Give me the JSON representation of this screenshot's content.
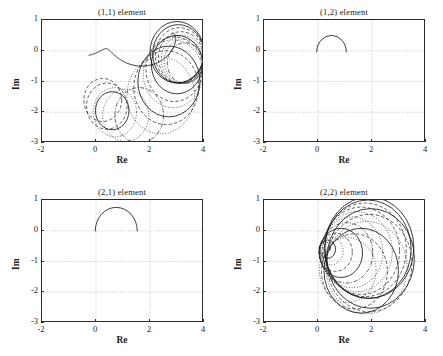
{
  "figure": {
    "layout": "2x2",
    "width": 443,
    "height": 356,
    "background": "#ffffff",
    "line_color": "#1a1a1a",
    "grid_color": "#b9b9b9",
    "frame_color": "#2b2b2b"
  },
  "axes": {
    "xlabel": "Re",
    "ylabel": "Im",
    "xticks": [
      "-2",
      "0",
      "2",
      "4"
    ],
    "xtick_values": [
      -2,
      0,
      2,
      4
    ],
    "yticks": [
      "1",
      "0",
      "-1",
      "-2",
      "-3"
    ],
    "ytick_values": [
      1,
      0,
      -1,
      -2,
      -3
    ],
    "xlim": [
      -2,
      4
    ],
    "ylim": [
      -3,
      1
    ],
    "grid": "dotted-at-integer-ticks"
  },
  "panels": [
    {
      "id": "p11",
      "title": "(1,1) element"
    },
    {
      "id": "p12",
      "title": "(1,2) element"
    },
    {
      "id": "p21",
      "title": "(2,1) element"
    },
    {
      "id": "p22",
      "title": "(2,2) element"
    }
  ],
  "chart_data": {
    "type": "line",
    "xlabel": "Re",
    "ylabel": "Im",
    "xlim": [
      -2,
      4
    ],
    "ylim": [
      -3,
      1
    ],
    "grid": true,
    "legend": "none",
    "subplots": [
      {
        "name": "(1,1) element",
        "description": "Dense family of circular Nyquist loci: a large cluster of near-tangent circles in the right region centered near Re 3, plus smaller circles near Re 0 to 1 around Im -1.8, connected by a spiralling solid locus.",
        "series": [
          {
            "name": "locus-1",
            "style": "solid",
            "shape": "circle",
            "cx": 3.0,
            "cy": -0.05,
            "r": 1.0
          },
          {
            "name": "locus-2",
            "style": "solid",
            "shape": "circle",
            "cx": 3.05,
            "cy": -0.1,
            "r": 0.95
          },
          {
            "name": "locus-3",
            "style": "dashed",
            "shape": "circle",
            "cx": 3.1,
            "cy": -0.15,
            "r": 0.9
          },
          {
            "name": "locus-4",
            "style": "dashed",
            "shape": "circle",
            "cx": 3.15,
            "cy": -0.22,
            "r": 0.84
          },
          {
            "name": "locus-5",
            "style": "dotted",
            "shape": "circle",
            "cx": 3.2,
            "cy": -0.28,
            "r": 0.78
          },
          {
            "name": "locus-6",
            "style": "dotted",
            "shape": "circle",
            "cx": 3.25,
            "cy": -0.34,
            "r": 0.72
          },
          {
            "name": "locus-7",
            "style": "dashdot",
            "shape": "circle",
            "cx": 3.3,
            "cy": -0.4,
            "r": 0.66
          },
          {
            "name": "locus-8",
            "style": "solid",
            "shape": "circle",
            "cx": 3.0,
            "cy": -0.45,
            "r": 0.95
          },
          {
            "name": "locus-9",
            "style": "dashed",
            "shape": "circle",
            "cx": 2.9,
            "cy": -0.6,
            "r": 1.05
          },
          {
            "name": "locus-10",
            "style": "dotted",
            "shape": "circle",
            "cx": 2.85,
            "cy": -0.75,
            "r": 1.1
          },
          {
            "name": "locus-11",
            "style": "solid",
            "shape": "circle",
            "cx": 2.7,
            "cy": -1.0,
            "r": 1.15
          },
          {
            "name": "locus-12",
            "style": "dashed",
            "shape": "circle",
            "cx": 2.6,
            "cy": -1.2,
            "r": 1.2
          },
          {
            "name": "locus-13",
            "style": "dotted",
            "shape": "circle",
            "cx": 2.4,
            "cy": -1.45,
            "r": 1.25
          },
          {
            "name": "locus-14",
            "style": "solid",
            "shape": "circle",
            "cx": 0.6,
            "cy": -1.95,
            "r": 0.62
          },
          {
            "name": "locus-15",
            "style": "dashed",
            "shape": "circle",
            "cx": 0.4,
            "cy": -1.8,
            "r": 0.75
          },
          {
            "name": "locus-16",
            "style": "dashed",
            "shape": "circle",
            "cx": 0.25,
            "cy": -1.6,
            "r": 0.7
          },
          {
            "name": "locus-17",
            "style": "dotted",
            "shape": "circle",
            "cx": 0.7,
            "cy": -2.0,
            "r": 0.8
          },
          {
            "name": "locus-18",
            "style": "dotted",
            "shape": "circle",
            "cx": 1.1,
            "cy": -2.1,
            "r": 0.85
          },
          {
            "name": "locus-19",
            "style": "dashdot",
            "shape": "circle",
            "cx": 1.6,
            "cy": -2.1,
            "r": 0.9
          },
          {
            "name": "locus-20",
            "style": "solid",
            "shape": "spiral",
            "from": [
              -0.35,
              -0.15
            ],
            "to": [
              3.0,
              -0.05
            ]
          }
        ]
      },
      {
        "name": "(1,2) element",
        "description": "Single small semicircular locus in the upper-middle region; starts at the origin, loops down to about Im -0.6 and returns to the real axis near Re 1.",
        "series": [
          {
            "name": "locus-1",
            "style": "solid",
            "shape": "arc",
            "cx": 0.5,
            "cy": -0.05,
            "r": 0.55,
            "a0": 0,
            "a1": 180
          }
        ]
      },
      {
        "name": "(2,1) element",
        "description": "Single semicircular locus from the origin dipping to about Im -0.8 and returning to the real axis near Re 1.5.",
        "series": [
          {
            "name": "locus-1",
            "style": "solid",
            "shape": "arc",
            "cx": 0.75,
            "cy": -0.02,
            "r": 0.78,
            "a0": 0,
            "a1": 180
          }
        ]
      },
      {
        "name": "(2,2) element",
        "description": "Family of circular loci all passing through a tight knot near Re 0.2, Im -0.5 and expanding rightward; the largest circles reach Re 3.5 and Im -2.",
        "series": [
          {
            "name": "locus-1",
            "style": "solid",
            "shape": "circle",
            "cx": 1.9,
            "cy": -0.55,
            "r": 1.65
          },
          {
            "name": "locus-2",
            "style": "solid",
            "shape": "circle",
            "cx": 1.85,
            "cy": -0.6,
            "r": 1.6
          },
          {
            "name": "locus-3",
            "style": "dashed",
            "shape": "circle",
            "cx": 1.75,
            "cy": -0.62,
            "r": 1.52
          },
          {
            "name": "locus-4",
            "style": "dashed",
            "shape": "circle",
            "cx": 1.6,
            "cy": -0.65,
            "r": 1.42
          },
          {
            "name": "locus-5",
            "style": "dotted",
            "shape": "circle",
            "cx": 1.45,
            "cy": -0.68,
            "r": 1.3
          },
          {
            "name": "locus-6",
            "style": "dotted",
            "shape": "circle",
            "cx": 1.25,
            "cy": -0.7,
            "r": 1.15
          },
          {
            "name": "locus-7",
            "style": "dashdot",
            "shape": "circle",
            "cx": 1.05,
            "cy": -0.72,
            "r": 0.98
          },
          {
            "name": "locus-8",
            "style": "solid",
            "shape": "circle",
            "cx": 0.85,
            "cy": -0.72,
            "r": 0.8
          },
          {
            "name": "locus-9",
            "style": "dashed",
            "shape": "circle",
            "cx": 0.65,
            "cy": -0.7,
            "r": 0.62
          },
          {
            "name": "locus-10",
            "style": "dotted",
            "shape": "circle",
            "cx": 0.48,
            "cy": -0.66,
            "r": 0.45
          },
          {
            "name": "locus-11",
            "style": "solid",
            "shape": "circle",
            "cx": 0.35,
            "cy": -0.6,
            "r": 0.3
          },
          {
            "name": "locus-12",
            "style": "dashed",
            "shape": "circle",
            "cx": 0.26,
            "cy": -0.56,
            "r": 0.2
          },
          {
            "name": "locus-13",
            "style": "solid",
            "shape": "circle",
            "cx": 1.95,
            "cy": -0.9,
            "r": 1.62
          },
          {
            "name": "locus-14",
            "style": "dashed",
            "shape": "circle",
            "cx": 1.9,
            "cy": -1.05,
            "r": 1.58
          },
          {
            "name": "locus-15",
            "style": "dotted",
            "shape": "circle",
            "cx": 1.8,
            "cy": -1.2,
            "r": 1.5
          },
          {
            "name": "locus-16",
            "style": "solid",
            "shape": "circle",
            "cx": 1.6,
            "cy": -1.3,
            "r": 1.38
          },
          {
            "name": "locus-17",
            "style": "dashed",
            "shape": "circle",
            "cx": 1.35,
            "cy": -1.32,
            "r": 1.22
          },
          {
            "name": "locus-18",
            "style": "dotted",
            "shape": "circle",
            "cx": 1.1,
            "cy": -1.28,
            "r": 1.05
          }
        ]
      }
    ]
  }
}
